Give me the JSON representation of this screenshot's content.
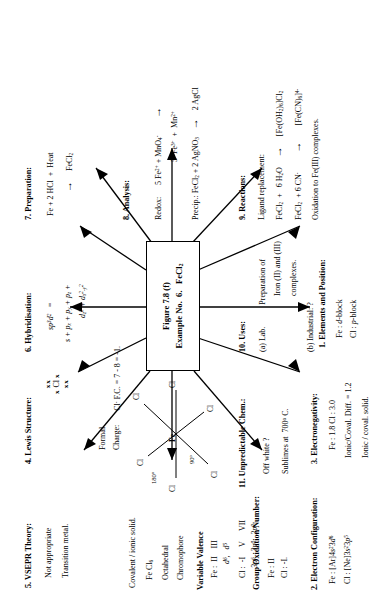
{
  "figure": {
    "center_title": "Figure 7.8 (f)",
    "center_example": "Example No.  6.   FeCl2"
  },
  "sections": {
    "s1": {
      "heading": "1.  Elements and  Position:",
      "lines": [
        "Fe : d-block",
        "Cl : p-block"
      ]
    },
    "s2": {
      "heading": "2.  Electron  Configuration:",
      "lines": [
        "Fe : [Ar]4s23d6",
        "Cl : [Ne]3s23p5"
      ],
      "sub_heading": "Group Oxidation Number:",
      "sub_lines": [
        "Fe : II",
        "Cl : -I."
      ],
      "valence_heading": "Variable  Valence",
      "valence_lines": [
        "Fe :  II     III",
        "d6,   d5",
        "Cl :  -I      V      VII",
        "3p6   3p0   3p0"
      ]
    },
    "s3": {
      "heading": "3.  Electronegativity:",
      "lines": [
        "Fe : 1.8   Cl : 3.0",
        "Ionic/Coval.   Diff. = 1.2",
        "Ionic / coval.  solid."
      ]
    },
    "s4": {
      "heading": "4.  Lewis Structure:",
      "lewis_center": "Cl",
      "lewis_dots_top": "xx",
      "lewis_dots_bottom": "xx",
      "lewis_dots_left": "x",
      "lewis_dots_right": "x",
      "formal": "Formal",
      "charge_label": "Charge:",
      "charge_value": "Cl- F.C. = 7 - 8 = -1."
    },
    "s5": {
      "heading": "5.  VSEPR Theory:",
      "lines": [
        "Not appropriate",
        "Transition  metal."
      ]
    },
    "s6": {
      "heading": "6.  Hybridisation:",
      "lines": [
        "sp3d2   =",
        "s + px + py + pz +",
        "dz2 + dx2-y2"
      ]
    },
    "s7": {
      "heading": "7.   Preparation:",
      "equation_left": "Fe + 2 HCl  +  Heat",
      "arrow": "→",
      "equation_right": "FeCl2"
    },
    "s8": {
      "heading": "8.  Analysis:",
      "redox_label": "Redox:",
      "redox_left": "5 Fe2+ + MnO4-",
      "redox_arrow": "→",
      "redox_right": "5  Fe3+  +  Mn2+",
      "precip": "Precip.: FeCl2 + 2 AgNO3",
      "precip_arrow": "→",
      "precip_right": "2 AgCl"
    },
    "s9": {
      "heading": "9.    Reactions:",
      "ligand_label": "Ligand  replacement:",
      "r1_left": "FeCl2  +   6 H2O",
      "r1_arrow": "→",
      "r1_right": "[Fe(OH2)6]Cl2",
      "r2_left": "FeCl2  + 6 CN-",
      "r2_arrow": "→",
      "r2_right": "[Fe(CN)6]4-",
      "note": "Oxidation to Fe(III) complexes."
    },
    "s10": {
      "heading": "10.   Uses:",
      "item_a_label": "(a)  Lab.",
      "item_a_text": [
        "Preparation of",
        "Iron (II) and (III)",
        "complexes."
      ],
      "item_b": "(b) Industrial:   ?"
    },
    "s11": {
      "heading": "11.   Unpredictable  Chem.:",
      "lines": [
        "Off white ?",
        "Sublimes at  7000 C."
      ]
    },
    "covalent": {
      "heading": "Covalent / ionic solid.",
      "lines": [
        "Fe Cl6",
        "Octahedral",
        "Chromophore"
      ],
      "angle_180": "1800",
      "angle_90": "900",
      "center_atom": "Fe",
      "ligands": [
        "Cl",
        "Cl",
        "Cl",
        "Cl",
        "Cl",
        "Cl"
      ]
    }
  },
  "colors": {
    "ink": "#000000",
    "paper": "#ffffff"
  }
}
